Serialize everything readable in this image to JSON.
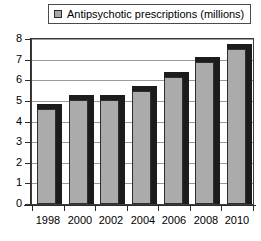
{
  "chart_data": {
    "type": "bar",
    "title": "",
    "subtitle": "",
    "xlabel": "",
    "ylabel": "",
    "categories": [
      "1998",
      "2000",
      "2002",
      "2004",
      "2006",
      "2008",
      "2010"
    ],
    "values": [
      4.6,
      5.05,
      5.05,
      5.5,
      6.15,
      6.9,
      7.5
    ],
    "series": [
      {
        "name": "Antipsychotic prescriptions (millions)",
        "values": [
          4.6,
          5.05,
          5.05,
          5.5,
          6.15,
          6.9,
          7.5
        ]
      }
    ],
    "ylim": [
      0,
      8
    ],
    "yticks": [
      0,
      1,
      2,
      3,
      4,
      5,
      6,
      7,
      8
    ],
    "ytick_labels": [
      "0",
      "1",
      "2",
      "3",
      "4",
      "5",
      "6",
      "7",
      "8"
    ],
    "xtick_labels": [
      "1998",
      "2000",
      "2002",
      "2004",
      "2006",
      "2008",
      "2010"
    ],
    "grid": true,
    "grid_axis": "y",
    "legend": {
      "position": "top",
      "entries": [
        {
          "label": "Antipsychotic prescriptions (millions)",
          "swatch_color": "#a8a8a8",
          "swatch_border_color": "#2b2b2b"
        }
      ]
    },
    "style": {
      "bar_face_color": "#ababab",
      "bar_shadow_color": "#1c1c1c",
      "bar_border_color": "#2e2e2e",
      "gridline_color": "#9a9a9a",
      "axis_color": "#2b2b2b",
      "background_color": "#ffffff",
      "text_color": "#000000",
      "three_d": true
    }
  }
}
